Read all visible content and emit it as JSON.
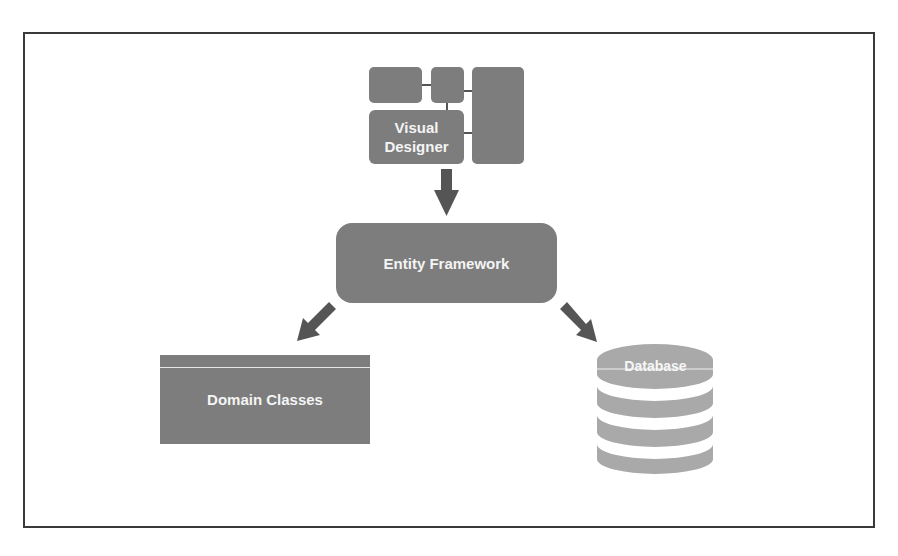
{
  "diagram": {
    "nodes": {
      "visual_designer": {
        "label_line1": "Visual",
        "label_line2": "Designer"
      },
      "entity_framework": {
        "label": "Entity Framework"
      },
      "domain_classes": {
        "label": "Domain Classes"
      },
      "database": {
        "label": "Database"
      }
    },
    "edges": [
      {
        "from": "Visual Designer",
        "to": "Entity Framework"
      },
      {
        "from": "Entity Framework",
        "to": "Domain Classes"
      },
      {
        "from": "Entity Framework",
        "to": "Database"
      }
    ],
    "colors": {
      "box_fill": "#7d7d7d",
      "arrow_fill": "#555555",
      "database_fill": "#a9a9a9",
      "text": "#f4f4f4",
      "frame": "#3a3a3a"
    }
  }
}
